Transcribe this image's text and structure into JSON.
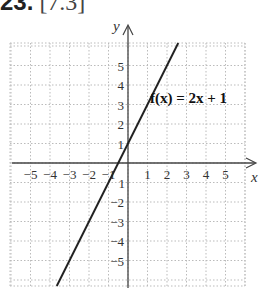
{
  "heading": {
    "number": "23.",
    "reference": "[7.3]"
  },
  "chart_data": {
    "type": "line",
    "title": "",
    "function_label": "f(x) = 2x + 1",
    "xlabel": "x",
    "ylabel": "y",
    "xlim": [
      -6,
      6
    ],
    "ylim": [
      -6,
      6
    ],
    "grid": true,
    "grid_style": "dotted",
    "x_ticks": [
      -5,
      -4,
      -3,
      -2,
      -1,
      1,
      2,
      3,
      4,
      5
    ],
    "y_ticks": [
      -5,
      -4,
      -3,
      -2,
      -1,
      1,
      2,
      3,
      4,
      5
    ],
    "x_tick_labels": [
      "−5",
      "−4",
      "−3",
      "−2",
      "−1",
      "1",
      "2",
      "3",
      "4",
      "5"
    ],
    "y_tick_labels": [
      "−5",
      "−4",
      "−3",
      "−2",
      "−1",
      "1",
      "2",
      "3",
      "4",
      "5"
    ],
    "series": [
      {
        "name": "f(x) = 2x + 1",
        "slope": 2,
        "intercept": 1,
        "x": [
          -3,
          -2,
          -1,
          0,
          1,
          2
        ],
        "y": [
          -5,
          -3,
          -1,
          1,
          3,
          5
        ]
      }
    ],
    "line_color": "#222222"
  }
}
